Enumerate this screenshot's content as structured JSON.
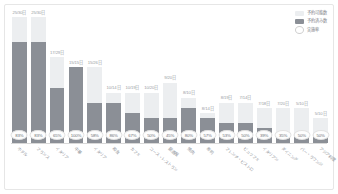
{
  "chart_data": {
    "type": "bar",
    "title": "",
    "subtitle": "",
    "xlabel": "",
    "ylabel": "",
    "ylim": [
      0,
      25
    ],
    "grid": false,
    "stacked": true,
    "legend_position": "top-right",
    "categories": [
      "ホテル",
      "フランス",
      "イタリア",
      "中華",
      "イタリア",
      "和食",
      "カフェ",
      "コース・レストラン",
      "居酒屋",
      "焼肉",
      "寿司",
      "フレンチ・ビストロ",
      "ビュッフェ",
      "イタリアン",
      "ダイニング",
      "バー・ラウンジ",
      "アジア料理"
    ],
    "series": [
      {
        "name": "予約可能数",
        "key": "total",
        "values": [
          25,
          25,
          17,
          15,
          15,
          10,
          10,
          10,
          12,
          9,
          6,
          8,
          8,
          7,
          7,
          7,
          5
        ]
      },
      {
        "name": "予約済み数",
        "key": "sold",
        "values": [
          20,
          20,
          11,
          15,
          8,
          8,
          6,
          5,
          5,
          7,
          5,
          4,
          4,
          3,
          2,
          2,
          2
        ]
      }
    ],
    "bar_labels": [
      "25/30日",
      "25/30日",
      "17/29日",
      "15/15日",
      "15/26日",
      "10/14日",
      "10/19日",
      "10/20日",
      "9/20日",
      "8/10日",
      "8/14日",
      "8/19日",
      "7/14日",
      "7/18日",
      "7/20日",
      "5/10日",
      "5/10日"
    ],
    "rates": [
      "83%",
      "83%",
      "65%",
      "100%",
      "58%",
      "86%",
      "67%",
      "50%",
      "45%",
      "80%",
      "57%",
      "53%",
      "50%",
      "39%",
      "35%",
      "50%",
      "50%"
    ],
    "legend": [
      {
        "label": "予約可能数",
        "swatch": "light",
        "color": "#eceef0"
      },
      {
        "label": "予約済み数",
        "swatch": "dark",
        "color": "#8b8f96"
      },
      {
        "label": "実施率",
        "swatch": "circle",
        "color": "#ffffff"
      }
    ]
  },
  "colors": {
    "bar_total": "#eceef0",
    "bar_sold": "#8b8f96",
    "card_border": "#e6e6e6",
    "axis": "#d8d8d8",
    "text": "#8d9197"
  }
}
